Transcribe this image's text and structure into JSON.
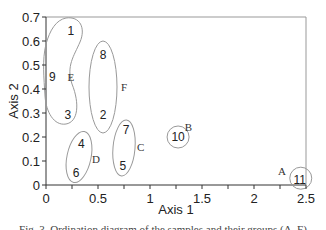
{
  "chart_data": {
    "type": "scatter",
    "title": "",
    "xlabel": "Axis 1",
    "ylabel": "Axis 2",
    "xlim": [
      0,
      2.5
    ],
    "ylim": [
      0,
      0.7
    ],
    "xticks": [
      0,
      0.5,
      1,
      1.5,
      2,
      2.5
    ],
    "xtick_labels": [
      "0",
      "0.5",
      "1",
      "1.5",
      "2",
      "2.5"
    ],
    "yticks": [
      0,
      0.1,
      0.2,
      0.3,
      0.4,
      0.5,
      0.6,
      0.7
    ],
    "ytick_labels": [
      "0",
      "0.1",
      "0.2",
      "0.3",
      "0.4",
      "0.5",
      "0.6",
      "0.7"
    ],
    "grid": false,
    "points": [
      {
        "label": "1",
        "x": 0.24,
        "y": 0.64,
        "group": "E"
      },
      {
        "label": "2",
        "x": 0.55,
        "y": 0.29,
        "group": "F"
      },
      {
        "label": "3",
        "x": 0.21,
        "y": 0.29,
        "group": "E"
      },
      {
        "label": "4",
        "x": 0.34,
        "y": 0.17,
        "group": "D"
      },
      {
        "label": "5",
        "x": 0.74,
        "y": 0.08,
        "group": "C"
      },
      {
        "label": "6",
        "x": 0.29,
        "y": 0.05,
        "group": "D"
      },
      {
        "label": "7",
        "x": 0.77,
        "y": 0.23,
        "group": "C"
      },
      {
        "label": "8",
        "x": 0.55,
        "y": 0.54,
        "group": "F"
      },
      {
        "label": "9",
        "x": 0.06,
        "y": 0.45,
        "group": "E"
      },
      {
        "label": "10",
        "x": 1.27,
        "y": 0.2,
        "group": "B"
      },
      {
        "label": "11",
        "x": 2.44,
        "y": 0.02,
        "group": "A"
      }
    ],
    "groups": [
      {
        "name": "A",
        "members": [
          "11"
        ],
        "label_x": 2.27,
        "label_y": 0.06
      },
      {
        "name": "B",
        "members": [
          "10"
        ],
        "label_x": 1.37,
        "label_y": 0.24
      },
      {
        "name": "C",
        "members": [
          "7",
          "5"
        ],
        "label_x": 0.91,
        "label_y": 0.16
      },
      {
        "name": "D",
        "members": [
          "4",
          "6"
        ],
        "label_x": 0.48,
        "label_y": 0.11
      },
      {
        "name": "E",
        "members": [
          "1",
          "9",
          "3"
        ],
        "label_x": 0.24,
        "label_y": 0.45
      },
      {
        "name": "F",
        "members": [
          "8",
          "2"
        ],
        "label_x": 0.75,
        "label_y": 0.41
      }
    ]
  },
  "caption": "Fig. 3. Ordination diagram of the samples and their groups (A–F)"
}
